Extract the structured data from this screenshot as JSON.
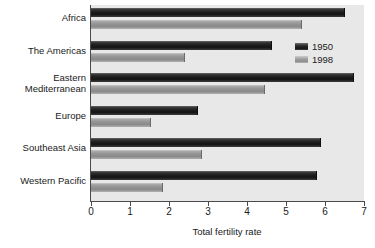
{
  "chart_data": {
    "type": "bar",
    "orientation": "horizontal",
    "title": "",
    "xlabel": "Total fertility rate",
    "ylabel": "",
    "xlim": [
      0,
      7
    ],
    "xticks": [
      "0",
      "1",
      "2",
      "3",
      "4",
      "5",
      "6",
      "7"
    ],
    "grid": false,
    "legend_position": "top-right",
    "categories": [
      "Africa",
      "The Americas",
      "Eastern\nMediterranean",
      "Europe",
      "Southeast Asia",
      "Western Pacific"
    ],
    "series": [
      {
        "name": "1950",
        "color": "#1d1d1d",
        "values": [
          6.5,
          4.65,
          6.75,
          2.75,
          5.9,
          5.8
        ]
      },
      {
        "name": "1998",
        "color": "#939393",
        "values": [
          5.4,
          2.4,
          4.45,
          1.55,
          2.85,
          1.85
        ]
      }
    ]
  },
  "legend": {
    "items": [
      {
        "label": "1950"
      },
      {
        "label": "1998"
      }
    ]
  },
  "axis": {
    "x_title": "Total fertility rate"
  },
  "colors": {
    "plot_background": "#e8e8e8",
    "page_background": "#ffffff",
    "axis": "#4a4a4a",
    "series_1950": "#1d1d1d",
    "series_1998": "#939393",
    "text": "#1a1a1a"
  }
}
